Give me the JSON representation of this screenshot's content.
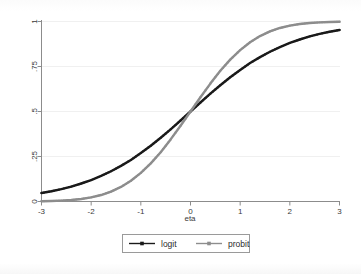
{
  "chart_data": {
    "type": "line",
    "title": "",
    "subtitle": "",
    "xlabel": "eta",
    "ylabel": "",
    "xlim": [
      -3,
      3
    ],
    "ylim": [
      0,
      1
    ],
    "grid": true,
    "grid_orientation": "horizontal",
    "legend_position": "bottom",
    "x_ticks": [
      -3,
      -2,
      -1,
      0,
      1,
      2,
      3
    ],
    "x_tick_labels": [
      "-3",
      "-2",
      "-1",
      "0",
      "1",
      "2",
      "3"
    ],
    "y_ticks": [
      0,
      0.25,
      0.5,
      0.75,
      1
    ],
    "y_tick_labels": [
      "0",
      ".25",
      ".5",
      ".75",
      "1"
    ],
    "x": [
      -3,
      -2.8,
      -2.6,
      -2.4,
      -2.2,
      -2,
      -1.8,
      -1.6,
      -1.4,
      -1.2,
      -1,
      -0.8,
      -0.6,
      -0.4,
      -0.2,
      0,
      0.2,
      0.4,
      0.6,
      0.8,
      1,
      1.2,
      1.4,
      1.6,
      1.8,
      2,
      2.2,
      2.4,
      2.6,
      2.8,
      3
    ],
    "series": [
      {
        "name": "logit",
        "color": "#1a1a1a",
        "marker": "square",
        "values": [
          0.047,
          0.057,
          0.069,
          0.083,
          0.1,
          0.119,
          0.142,
          0.168,
          0.198,
          0.231,
          0.269,
          0.31,
          0.354,
          0.401,
          0.45,
          0.5,
          0.55,
          0.599,
          0.646,
          0.69,
          0.731,
          0.769,
          0.802,
          0.832,
          0.858,
          0.881,
          0.9,
          0.917,
          0.931,
          0.943,
          0.953
        ]
      },
      {
        "name": "probit",
        "color": "#8d8d8d",
        "marker": "square",
        "values": [
          0.001,
          0.003,
          0.005,
          0.008,
          0.014,
          0.023,
          0.036,
          0.055,
          0.081,
          0.115,
          0.159,
          0.212,
          0.274,
          0.345,
          0.421,
          0.5,
          0.579,
          0.655,
          0.726,
          0.788,
          0.841,
          0.885,
          0.919,
          0.945,
          0.964,
          0.977,
          0.986,
          0.992,
          0.995,
          0.997,
          0.999
        ]
      }
    ]
  },
  "axes": {
    "x_title": "eta"
  },
  "legend": {
    "entries": [
      {
        "label": "logit",
        "color": "#1a1a1a"
      },
      {
        "label": "probit",
        "color": "#8d8d8d"
      }
    ]
  }
}
